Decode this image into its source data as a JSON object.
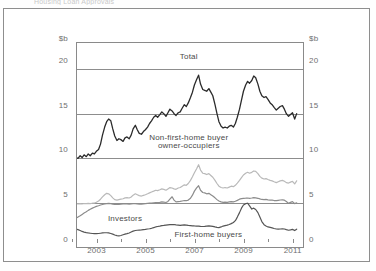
{
  "figure": {
    "clipped_caption_fragment": "Housing Loan Approvals",
    "axis_unit_left": "$b",
    "axis_unit_right": "$b"
  },
  "chart_data": {
    "type": "line",
    "title": "",
    "xlabel": "",
    "ylabel": "$b",
    "ylim": [
      0,
      23
    ],
    "xlim": [
      2002.0,
      2011.3
    ],
    "grid": true,
    "gridlines_y": [
      5,
      10,
      15,
      20
    ],
    "legend": "in-plot labels",
    "y_ticks": [
      "0",
      "5",
      "10",
      "15",
      "20"
    ],
    "y_tick_values": [
      0,
      5,
      10,
      15,
      20
    ],
    "x_ticks": [
      "2003",
      "2005",
      "2007",
      "2009",
      "2011"
    ],
    "x_tick_values": [
      2003,
      2005,
      2007,
      2009,
      2011
    ],
    "x_minor_ticks": [
      2002,
      2004,
      2006,
      2008,
      2010
    ],
    "annotations": [
      {
        "text": "Total",
        "x": 2006.6,
        "y": 21.2
      },
      {
        "text": "Non-first-home buyer",
        "x": 2006.6,
        "y": 12.2
      },
      {
        "text": "owner-occupiers",
        "x": 2006.6,
        "y": 11.3
      },
      {
        "text": "Investors",
        "x": 2004.0,
        "y": 3.1
      },
      {
        "text": "First-home buyers",
        "x": 2007.4,
        "y": 1.35
      }
    ],
    "series": [
      {
        "name": "Total",
        "color": "#2b2b2b",
        "width": 1.3,
        "x": [
          2002.0,
          2002.08,
          2002.17,
          2002.25,
          2002.33,
          2002.42,
          2002.5,
          2002.58,
          2002.67,
          2002.75,
          2002.83,
          2002.92,
          2003.0,
          2003.08,
          2003.17,
          2003.25,
          2003.33,
          2003.42,
          2003.5,
          2003.58,
          2003.67,
          2003.75,
          2003.83,
          2003.92,
          2004.0,
          2004.08,
          2004.17,
          2004.25,
          2004.33,
          2004.42,
          2004.5,
          2004.58,
          2004.67,
          2004.75,
          2004.83,
          2004.92,
          2005.0,
          2005.08,
          2005.17,
          2005.25,
          2005.33,
          2005.42,
          2005.5,
          2005.58,
          2005.67,
          2005.75,
          2005.83,
          2005.92,
          2006.0,
          2006.08,
          2006.17,
          2006.25,
          2006.33,
          2006.42,
          2006.5,
          2006.58,
          2006.67,
          2006.75,
          2006.83,
          2006.92,
          2007.0,
          2007.08,
          2007.17,
          2007.25,
          2007.33,
          2007.42,
          2007.5,
          2007.58,
          2007.67,
          2007.75,
          2007.83,
          2007.92,
          2008.0,
          2008.08,
          2008.17,
          2008.25,
          2008.33,
          2008.42,
          2008.5,
          2008.58,
          2008.67,
          2008.75,
          2008.83,
          2008.92,
          2009.0,
          2009.08,
          2009.17,
          2009.25,
          2009.33,
          2009.42,
          2009.5,
          2009.58,
          2009.67,
          2009.75,
          2009.83,
          2009.92,
          2010.0,
          2010.08,
          2010.17,
          2010.25,
          2010.33,
          2010.42,
          2010.5,
          2010.58,
          2010.67,
          2010.75,
          2010.83,
          2010.92,
          2011.0
        ],
        "values": [
          10.1,
          10.0,
          10.3,
          10.1,
          10.4,
          10.2,
          10.5,
          10.3,
          10.6,
          10.5,
          10.8,
          11.0,
          11.6,
          12.6,
          13.5,
          14.1,
          14.4,
          14.2,
          13.3,
          12.5,
          12.0,
          12.2,
          12.1,
          11.9,
          12.3,
          12.4,
          12.2,
          12.6,
          13.3,
          13.7,
          13.2,
          12.8,
          12.7,
          13.0,
          13.2,
          13.5,
          13.9,
          14.2,
          14.6,
          14.8,
          14.6,
          14.9,
          15.2,
          15.0,
          14.7,
          15.1,
          15.5,
          15.3,
          15.0,
          14.8,
          15.1,
          15.2,
          15.6,
          16.0,
          15.8,
          16.2,
          16.8,
          17.4,
          18.2,
          18.8,
          19.3,
          18.3,
          17.7,
          17.6,
          17.5,
          17.8,
          17.4,
          17.0,
          16.0,
          15.0,
          14.1,
          13.6,
          13.4,
          13.5,
          13.4,
          13.6,
          13.7,
          13.5,
          13.9,
          14.6,
          15.5,
          16.5,
          17.5,
          18.2,
          18.6,
          18.4,
          18.7,
          19.2,
          19.0,
          18.3,
          17.5,
          17.0,
          16.8,
          16.9,
          16.6,
          16.2,
          16.0,
          15.7,
          15.4,
          15.6,
          15.8,
          15.9,
          15.5,
          15.0,
          14.7,
          14.9,
          15.1,
          14.4,
          15.0
        ]
      },
      {
        "name": "Non-first-home buyer owner-occupiers",
        "color": "#b9b9b9",
        "width": 1.2,
        "x": [
          2002.0,
          2002.08,
          2002.17,
          2002.25,
          2002.33,
          2002.42,
          2002.5,
          2002.58,
          2002.67,
          2002.75,
          2002.83,
          2002.92,
          2003.0,
          2003.08,
          2003.17,
          2003.25,
          2003.33,
          2003.42,
          2003.5,
          2003.58,
          2003.67,
          2003.75,
          2003.83,
          2003.92,
          2004.0,
          2004.08,
          2004.17,
          2004.25,
          2004.33,
          2004.42,
          2004.5,
          2004.58,
          2004.67,
          2004.75,
          2004.83,
          2004.92,
          2005.0,
          2005.08,
          2005.17,
          2005.25,
          2005.33,
          2005.42,
          2005.5,
          2005.58,
          2005.67,
          2005.75,
          2005.83,
          2005.92,
          2006.0,
          2006.08,
          2006.17,
          2006.25,
          2006.33,
          2006.42,
          2006.5,
          2006.58,
          2006.67,
          2006.75,
          2006.83,
          2006.92,
          2007.0,
          2007.08,
          2007.17,
          2007.25,
          2007.33,
          2007.42,
          2007.5,
          2007.58,
          2007.67,
          2007.75,
          2007.83,
          2007.92,
          2008.0,
          2008.08,
          2008.17,
          2008.25,
          2008.33,
          2008.42,
          2008.5,
          2008.58,
          2008.67,
          2008.75,
          2008.83,
          2008.92,
          2009.0,
          2009.08,
          2009.17,
          2009.25,
          2009.33,
          2009.42,
          2009.5,
          2009.58,
          2009.67,
          2009.75,
          2009.83,
          2009.92,
          2010.0,
          2010.08,
          2010.17,
          2010.25,
          2010.33,
          2010.42,
          2010.5,
          2010.58,
          2010.67,
          2010.75,
          2010.83,
          2010.92,
          2011.0
        ],
        "values": [
          4.95,
          4.92,
          4.96,
          4.93,
          4.97,
          4.95,
          4.98,
          4.96,
          5.0,
          5.02,
          5.1,
          5.25,
          5.45,
          5.7,
          5.95,
          6.1,
          6.05,
          5.85,
          5.6,
          5.4,
          5.35,
          5.4,
          5.45,
          5.5,
          5.6,
          5.62,
          5.58,
          5.7,
          5.9,
          6.05,
          5.95,
          5.85,
          5.8,
          5.88,
          5.95,
          6.05,
          6.15,
          6.25,
          6.35,
          6.45,
          6.4,
          6.5,
          6.6,
          6.55,
          6.45,
          6.6,
          6.75,
          6.7,
          6.6,
          6.55,
          6.7,
          6.75,
          6.9,
          7.05,
          7.0,
          7.2,
          7.55,
          7.95,
          8.4,
          8.85,
          9.3,
          8.7,
          8.35,
          8.3,
          8.2,
          8.3,
          8.1,
          7.9,
          7.55,
          7.2,
          6.9,
          6.75,
          6.7,
          6.75,
          6.7,
          6.8,
          6.9,
          6.85,
          7.0,
          7.25,
          7.55,
          7.85,
          8.15,
          8.35,
          8.45,
          8.35,
          8.45,
          8.6,
          8.55,
          8.3,
          8.0,
          7.8,
          7.7,
          7.75,
          7.65,
          7.55,
          7.5,
          7.4,
          7.3,
          7.4,
          7.5,
          7.55,
          7.45,
          7.3,
          7.25,
          7.35,
          7.45,
          7.15,
          7.5
        ]
      },
      {
        "name": "Investors",
        "color": "#8c8c8c",
        "width": 1.2,
        "x": [
          2002.0,
          2002.08,
          2002.17,
          2002.25,
          2002.33,
          2002.42,
          2002.5,
          2002.58,
          2002.67,
          2002.75,
          2002.83,
          2002.92,
          2003.0,
          2003.08,
          2003.17,
          2003.25,
          2003.33,
          2003.42,
          2003.5,
          2003.58,
          2003.67,
          2003.75,
          2003.83,
          2003.92,
          2004.0,
          2004.08,
          2004.17,
          2004.25,
          2004.33,
          2004.42,
          2004.5,
          2004.58,
          2004.67,
          2004.75,
          2004.83,
          2004.92,
          2005.0,
          2005.08,
          2005.17,
          2005.25,
          2005.33,
          2005.42,
          2005.5,
          2005.58,
          2005.67,
          2005.75,
          2005.83,
          2005.92,
          2006.0,
          2006.08,
          2006.17,
          2006.25,
          2006.33,
          2006.42,
          2006.5,
          2006.58,
          2006.67,
          2006.75,
          2006.83,
          2006.92,
          2007.0,
          2007.08,
          2007.17,
          2007.25,
          2007.33,
          2007.42,
          2007.5,
          2007.58,
          2007.67,
          2007.75,
          2007.83,
          2007.92,
          2008.0,
          2008.08,
          2008.17,
          2008.25,
          2008.33,
          2008.42,
          2008.5,
          2008.58,
          2008.67,
          2008.75,
          2008.83,
          2008.92,
          2009.0,
          2009.08,
          2009.17,
          2009.25,
          2009.33,
          2009.42,
          2009.5,
          2009.58,
          2009.67,
          2009.75,
          2009.83,
          2009.92,
          2010.0,
          2010.08,
          2010.17,
          2010.25,
          2010.33,
          2010.42,
          2010.5,
          2010.58,
          2010.67,
          2010.75,
          2010.83,
          2010.92,
          2011.0
        ],
        "values": [
          3.35,
          3.45,
          3.6,
          3.75,
          3.9,
          4.05,
          4.2,
          4.32,
          4.45,
          4.55,
          4.65,
          4.72,
          4.8,
          4.86,
          4.92,
          4.96,
          4.98,
          4.95,
          4.9,
          4.88,
          4.86,
          4.88,
          4.9,
          4.92,
          4.94,
          4.93,
          4.9,
          4.92,
          4.95,
          4.96,
          4.92,
          4.9,
          4.89,
          4.92,
          4.95,
          4.98,
          5.0,
          5.02,
          5.05,
          5.08,
          5.06,
          5.1,
          5.15,
          5.12,
          5.08,
          5.2,
          5.45,
          5.72,
          5.35,
          5.15,
          5.18,
          5.2,
          5.25,
          5.3,
          5.28,
          5.35,
          5.55,
          5.9,
          6.35,
          6.72,
          6.95,
          6.45,
          6.2,
          6.15,
          6.05,
          6.1,
          5.95,
          5.8,
          5.6,
          5.4,
          5.25,
          5.15,
          5.1,
          5.12,
          5.1,
          5.14,
          5.18,
          5.15,
          5.22,
          5.32,
          5.45,
          5.52,
          5.55,
          5.56,
          5.58,
          5.55,
          5.58,
          5.62,
          5.6,
          5.55,
          5.48,
          5.42,
          5.4,
          5.42,
          5.38,
          5.35,
          5.34,
          5.3,
          5.28,
          5.32,
          5.36,
          5.38,
          5.34,
          5.2,
          4.98,
          5.1,
          5.18,
          4.95,
          5.05
        ]
      },
      {
        "name": "First-home buyers",
        "color": "#555555",
        "width": 1.2,
        "x": [
          2002.0,
          2002.08,
          2002.17,
          2002.25,
          2002.33,
          2002.42,
          2002.5,
          2002.58,
          2002.67,
          2002.75,
          2002.83,
          2002.92,
          2003.0,
          2003.08,
          2003.17,
          2003.25,
          2003.33,
          2003.42,
          2003.5,
          2003.58,
          2003.67,
          2003.75,
          2003.83,
          2003.92,
          2004.0,
          2004.08,
          2004.17,
          2004.25,
          2004.33,
          2004.42,
          2004.5,
          2004.58,
          2004.67,
          2004.75,
          2004.83,
          2004.92,
          2005.0,
          2005.08,
          2005.17,
          2005.25,
          2005.33,
          2005.42,
          2005.5,
          2005.58,
          2005.67,
          2005.75,
          2005.83,
          2005.92,
          2006.0,
          2006.08,
          2006.17,
          2006.25,
          2006.33,
          2006.42,
          2006.5,
          2006.58,
          2006.67,
          2006.75,
          2006.83,
          2006.92,
          2007.0,
          2007.08,
          2007.17,
          2007.25,
          2007.33,
          2007.42,
          2007.5,
          2007.58,
          2007.67,
          2007.75,
          2007.83,
          2007.92,
          2008.0,
          2008.08,
          2008.17,
          2008.25,
          2008.33,
          2008.42,
          2008.5,
          2008.58,
          2008.67,
          2008.75,
          2008.83,
          2008.92,
          2009.0,
          2009.08,
          2009.17,
          2009.25,
          2009.33,
          2009.42,
          2009.5,
          2009.58,
          2009.67,
          2009.75,
          2009.83,
          2009.92,
          2010.0,
          2010.08,
          2010.17,
          2010.25,
          2010.33,
          2010.42,
          2010.5,
          2010.58,
          2010.67,
          2010.75,
          2010.83,
          2010.92,
          2011.0
        ],
        "values": [
          2.1,
          2.05,
          1.95,
          1.85,
          1.78,
          1.72,
          1.68,
          1.65,
          1.62,
          1.6,
          1.6,
          1.62,
          1.65,
          1.68,
          1.7,
          1.7,
          1.68,
          1.62,
          1.55,
          1.45,
          1.38,
          1.35,
          1.4,
          1.48,
          1.55,
          1.6,
          1.68,
          1.78,
          1.88,
          1.95,
          1.98,
          2.0,
          2.02,
          2.05,
          2.08,
          2.12,
          2.15,
          2.2,
          2.28,
          2.35,
          2.4,
          2.45,
          2.5,
          2.52,
          2.55,
          2.58,
          2.6,
          2.62,
          2.62,
          2.58,
          2.55,
          2.52,
          2.55,
          2.58,
          2.55,
          2.52,
          2.5,
          2.48,
          2.46,
          2.45,
          2.45,
          2.42,
          2.4,
          2.42,
          2.45,
          2.48,
          2.45,
          2.42,
          2.35,
          2.3,
          2.28,
          2.35,
          2.45,
          2.5,
          2.55,
          2.62,
          2.72,
          2.85,
          3.05,
          3.45,
          3.95,
          4.45,
          4.8,
          4.95,
          5.0,
          4.7,
          4.35,
          4.45,
          4.3,
          3.95,
          3.45,
          2.95,
          2.6,
          2.45,
          2.35,
          2.3,
          2.25,
          2.18,
          2.12,
          2.1,
          2.12,
          2.15,
          2.12,
          2.05,
          1.98,
          2.02,
          2.08,
          1.95,
          2.1
        ]
      }
    ]
  }
}
